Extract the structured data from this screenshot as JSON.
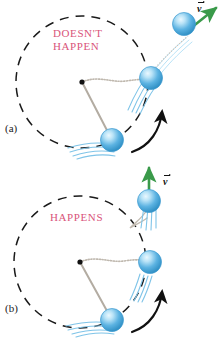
{
  "figure": {
    "background_color": "#ffffff"
  },
  "colors": {
    "caption_pink": "#d9547a",
    "ball_blue": "#4aa8dd",
    "ball_highlight": "#cdeaf8",
    "ball_outline": "#2f87b8",
    "arrow_green": "#3a9a4a",
    "motion_line_blue": "#7fc4e8",
    "string_gray": "#b9b2a8",
    "circle_dash": "#1a1a1a",
    "arrow_black": "#111111"
  },
  "panels": [
    {
      "id": "a",
      "letter": "(a)",
      "caption": "DOESN'T\nHAPPEN",
      "velocity_label": "v",
      "velocity_label_accent": "vector-arrow",
      "description": "Ball curves away along a bent path after release",
      "release_path": "curved"
    },
    {
      "id": "b",
      "letter": "(b)",
      "caption": "HAPPENS",
      "velocity_label": "v",
      "velocity_label_accent": "vector-arrow",
      "description": "Ball travels in a straight tangent line after release",
      "release_path": "straight-tangent"
    }
  ],
  "elements": {
    "pivot_name": "center-pivot-dot",
    "circle_name": "dashed-circular-path",
    "string_name": "string",
    "broken_string_name": "broken-string",
    "ball_name": "ball",
    "motion_lines_name": "motion-streak-lines",
    "rotation_arrow_name": "rotation-direction-arrow",
    "velocity_arrow_name": "velocity-arrow"
  }
}
